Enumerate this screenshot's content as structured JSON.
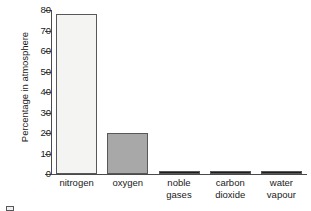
{
  "chart_data": {
    "type": "bar",
    "title": "",
    "xlabel": "",
    "ylabel": "Percentage in atmosphere",
    "ylim": [
      0,
      80
    ],
    "yticks": [
      0,
      10,
      20,
      30,
      40,
      50,
      60,
      70,
      80
    ],
    "grid": false,
    "legend": "none",
    "categories": [
      "nitrogen",
      "oxygen",
      "noble gases",
      "carbon dioxide",
      "water vapour"
    ],
    "category_lines": [
      [
        "nitrogen"
      ],
      [
        "oxygen"
      ],
      [
        "noble",
        "gases"
      ],
      [
        "carbon",
        "dioxide"
      ],
      [
        "water",
        "vapour"
      ]
    ],
    "values": [
      78,
      20,
      1,
      1,
      1
    ],
    "bar_colors": [
      "#f4f4f2",
      "#a8a8a8",
      "#1c1c1c",
      "#1c1c1c",
      "#1c1c1c"
    ],
    "bar_edge_color": "#58585a"
  },
  "legend_fragment": {
    "text": "",
    "swatch_color": "#efefed"
  }
}
